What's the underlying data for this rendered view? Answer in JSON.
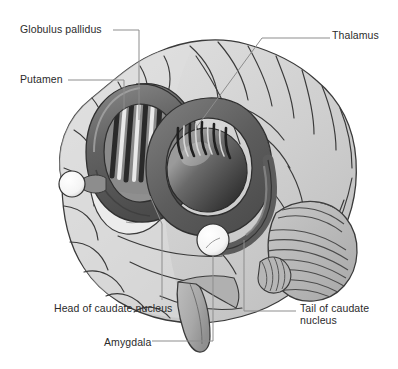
{
  "figure": {
    "kind": "anatomical-illustration",
    "style": "grayscale line-and-wash medical illustration"
  },
  "labels": [
    {
      "id": "globus-pallidus",
      "text": "Globulus pallidus",
      "x": 20,
      "y": 24,
      "align": "left"
    },
    {
      "id": "thalamus",
      "text": "Thalamus",
      "x": 332,
      "y": 30,
      "align": "left"
    },
    {
      "id": "putamen",
      "text": "Putamen",
      "x": 20,
      "y": 74,
      "align": "left"
    },
    {
      "id": "head-of-caudate-nucleus",
      "text": "Head of caudate nucleus",
      "x": 54,
      "y": 303,
      "align": "left"
    },
    {
      "id": "tail-of-caudate-nucleus",
      "text": "Tail of caudate\nnucleus",
      "x": 300,
      "y": 303,
      "align": "left"
    },
    {
      "id": "amygdala",
      "text": "Amygdala",
      "x": 104,
      "y": 337,
      "align": "left"
    }
  ],
  "structures": [
    {
      "id": "cerebral-cortex",
      "name": "Cerebral cortex",
      "shade": "#cfcfcf"
    },
    {
      "id": "frontal-lobe",
      "name": "Frontal lobe (gyri)",
      "shade": "#dcdcdc"
    },
    {
      "id": "cerebellum",
      "name": "Cerebellum",
      "shade": "#b9b9b9"
    },
    {
      "id": "brainstem",
      "name": "Brainstem",
      "shade": "#b4b4b4"
    },
    {
      "id": "caudate-ring",
      "name": "Caudate nucleus (C-shaped)",
      "shade": "#6e6e6e"
    },
    {
      "id": "globus-pallidus-body",
      "name": "Globus pallidus (striped)",
      "shade": "#8a8a8a"
    },
    {
      "id": "putamen-shell",
      "name": "Putamen (pale shell)",
      "shade": "#e6e6e6"
    },
    {
      "id": "thalamus-body",
      "name": "Thalamus (ovoid)",
      "shade": "#4a4a4a"
    },
    {
      "id": "amygdala-sphere",
      "name": "Amygdala (white sphere)",
      "shade": "#ffffff"
    }
  ],
  "colors": {
    "ink": "#2b2b2b",
    "leader": "#8d8d8d",
    "outline": "#3a3a3a",
    "background": "#ffffff"
  }
}
